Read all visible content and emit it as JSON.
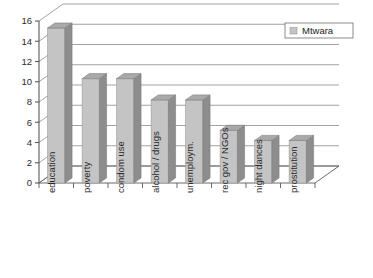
{
  "chart_data": {
    "type": "bar",
    "title": "",
    "subtitle": "",
    "xlabel": "",
    "ylabel": "",
    "categories": [
      "education",
      "poverty",
      "condom use",
      "alcohol / drugs",
      "unemploym.",
      "rec gov / NGOs",
      "night dances",
      "prostitution"
    ],
    "series": [
      {
        "name": "Mtwara",
        "values": [
          15.3,
          10.3,
          10.3,
          8.2,
          8.2,
          5.2,
          4.2,
          4.2
        ],
        "color": "#c4c4c4"
      }
    ],
    "values": [
      15.3,
      10.3,
      10.3,
      8.2,
      8.2,
      5.2,
      4.2,
      4.2
    ],
    "ylim": [
      0,
      16
    ],
    "ytick_step": 2,
    "yticks": [
      "0",
      "2",
      "4",
      "6",
      "8",
      "10",
      "12",
      "14",
      "16"
    ],
    "grid": true,
    "grid_axis": "y",
    "legend": {
      "position": "top-right",
      "entries": [
        {
          "label": "Mtwara",
          "swatch_color": "#c4c4c4"
        }
      ]
    },
    "style": {
      "three_d": true,
      "bar_face_color": "#c4c4c4",
      "bar_side_color": "#8d8d8d",
      "bar_top_color": "#a9a9a9",
      "axis_color": "#5a5a5a",
      "grid_color": "#8a8a8a",
      "background": "#ffffff",
      "label_rotation_deg": -90
    }
  },
  "axis": {
    "y_tick_labels": [
      "16",
      "14",
      "12",
      "10",
      "8",
      "6",
      "4",
      "2",
      "0"
    ]
  },
  "legend_text": {
    "mtwara": "Mtwara"
  }
}
